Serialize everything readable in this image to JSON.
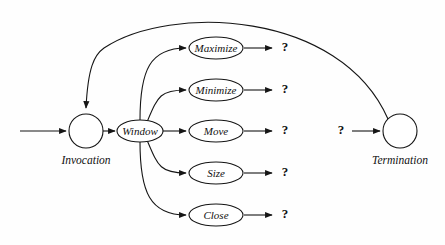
{
  "diagram": {
    "background_color": "#fefefe",
    "stroke_color": "#151515",
    "fill_color": "#ffffff",
    "start_node": {
      "name": "start-node",
      "caption": "Invocation",
      "shape": "circle",
      "cx": 86,
      "cy": 131,
      "r": 17
    },
    "end_node": {
      "name": "end-node",
      "caption": "Termination",
      "shape": "circle",
      "cx": 400,
      "cy": 131,
      "r": 17
    },
    "hub_node": {
      "name": "hub-node",
      "label": "Window",
      "shape": "ellipse",
      "cx": 140,
      "cy": 131,
      "rx": 23,
      "ry": 11
    },
    "action_nodes": [
      {
        "name": "maximize-node",
        "label": "Maximize",
        "cx": 216,
        "cy": 48,
        "rx": 27,
        "ry": 11,
        "result": "?",
        "result_x": 285,
        "result_y": 48
      },
      {
        "name": "minimize-node",
        "label": "Minimize",
        "cx": 216,
        "cy": 90,
        "rx": 27,
        "ry": 11,
        "result": "?",
        "result_x": 285,
        "result_y": 90
      },
      {
        "name": "move-node",
        "label": "Move",
        "cx": 216,
        "cy": 131,
        "rx": 27,
        "ry": 11,
        "result": "?",
        "result_x": 285,
        "result_y": 131
      },
      {
        "name": "size-node",
        "label": "Size",
        "cx": 216,
        "cy": 173,
        "rx": 27,
        "ry": 11,
        "result": "?",
        "result_x": 285,
        "result_y": 173
      },
      {
        "name": "close-node",
        "label": "Close",
        "cx": 216,
        "cy": 215,
        "rx": 27,
        "ry": 11,
        "result": "?",
        "result_x": 285,
        "result_y": 215
      }
    ],
    "termination_input": {
      "name": "termination-input-marker",
      "label": "?",
      "x": 341,
      "y": 131
    },
    "edges": [
      {
        "name": "edge-entry-to-invocation",
        "kind": "arrow-line",
        "path": "M 20 131 L 66 131"
      },
      {
        "name": "edge-invocation-to-window",
        "kind": "arrow-line",
        "path": "M 103 131 L 115 131"
      },
      {
        "name": "edge-window-to-maximize",
        "kind": "arrow-curve",
        "path": "M 140 120 C 140 70 150 48 186 48"
      },
      {
        "name": "edge-window-to-minimize",
        "kind": "arrow-curve",
        "path": "M 147 122 C 158 96 160 90 186 90"
      },
      {
        "name": "edge-window-to-move",
        "kind": "arrow-line",
        "path": "M 163 131 L 186 131"
      },
      {
        "name": "edge-window-to-size",
        "kind": "arrow-curve",
        "path": "M 147 140 C 158 166 160 173 186 173"
      },
      {
        "name": "edge-window-to-close",
        "kind": "arrow-curve",
        "path": "M 140 142 C 140 192 150 215 186 215"
      },
      {
        "name": "edge-maximize-to-result",
        "kind": "arrow-line",
        "path": "M 244 48 L 272 48"
      },
      {
        "name": "edge-minimize-to-result",
        "kind": "arrow-line",
        "path": "M 244 90 L 272 90"
      },
      {
        "name": "edge-move-to-result",
        "kind": "arrow-line",
        "path": "M 244 131 L 272 131"
      },
      {
        "name": "edge-size-to-result",
        "kind": "arrow-line",
        "path": "M 244 173 L 272 173"
      },
      {
        "name": "edge-close-to-result",
        "kind": "arrow-line",
        "path": "M 244 215 L 272 215"
      },
      {
        "name": "edge-termination-input-to-termination",
        "kind": "arrow-line",
        "path": "M 352 131 L 380 131"
      },
      {
        "name": "edge-termination-to-invocation-loop",
        "kind": "arrow-curve",
        "path": "M 388 119 C 340 10 170 4 104 48 C 94 55 88 68 86 108"
      }
    ]
  }
}
